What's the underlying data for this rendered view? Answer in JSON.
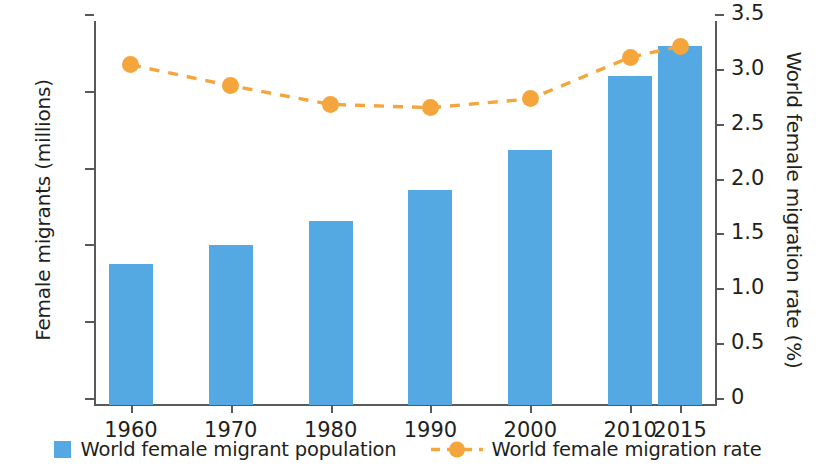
{
  "chart_data": {
    "type": "bar",
    "title": "",
    "subtitle": "",
    "xlabel": "",
    "ylabel": "Female migrants (millions)",
    "y2label": "World female migration rate (%)",
    "categories": [
      "1960",
      "1970",
      "1980",
      "1990",
      "2000",
      "2010",
      "2015"
    ],
    "grid": false,
    "legend_position": "bottom",
    "ylim": [
      0,
      125
    ],
    "yticks": [
      0,
      25,
      50,
      75,
      100,
      125
    ],
    "ytick_labels": [
      "0",
      "25",
      "50",
      "75",
      "100",
      "125"
    ],
    "y2lim": [
      0,
      3.5
    ],
    "y2ticks": [
      0,
      0.5,
      1.0,
      1.5,
      2.0,
      2.5,
      3.0,
      3.5
    ],
    "y2tick_labels": [
      "0",
      "0.5",
      "1.0",
      "1.5",
      "2.0",
      "2.5",
      "3.0",
      "3.5"
    ],
    "series": [
      {
        "name": "World female migrant population",
        "type": "bar",
        "axis": "left",
        "color": "#55a9e3",
        "values": [
          46,
          52,
          60,
          70,
          83,
          107,
          117
        ]
      },
      {
        "name": "World female migration rate",
        "type": "line",
        "axis": "right",
        "color": "#f4a63c",
        "linestyle": "dashed",
        "marker": "circle",
        "values": [
          3.1,
          2.91,
          2.74,
          2.71,
          2.79,
          3.17,
          3.27
        ]
      }
    ]
  },
  "legend": {
    "entries": [
      {
        "label": "World female migrant population",
        "swatch": "bar-swatch"
      },
      {
        "label": "World female migration rate",
        "swatch": "dashed-line-marker-swatch"
      }
    ]
  }
}
